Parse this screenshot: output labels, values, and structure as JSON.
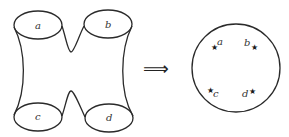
{
  "diagram": {
    "type": "topology-transformation",
    "stroke_color": "#2a2a2a",
    "left_figure": {
      "description": "surface with four boundary circles",
      "boundaries": [
        {
          "label": "a",
          "cx": 38,
          "cy": 25,
          "rx": 24,
          "ry": 14
        },
        {
          "label": "b",
          "cx": 108,
          "cy": 24,
          "rx": 24,
          "ry": 14
        },
        {
          "label": "c",
          "cx": 38,
          "cy": 117,
          "rx": 24,
          "ry": 14
        },
        {
          "label": "d",
          "cx": 109,
          "cy": 118,
          "rx": 24,
          "ry": 14
        }
      ]
    },
    "arrow": {
      "symbol": "⟹",
      "meaning": "implies / maps to"
    },
    "right_figure": {
      "description": "disk with four marked points",
      "circle": {
        "cx": 236,
        "cy": 68,
        "r": 44
      },
      "points": [
        {
          "label": "a",
          "star": "★",
          "star_x": 215,
          "star_y": 47,
          "label_x": 220,
          "label_y": 44,
          "label_side": "right"
        },
        {
          "label": "b",
          "star": "★",
          "star_x": 254,
          "star_y": 47,
          "label_x": 245,
          "label_y": 44,
          "label_side": "left"
        },
        {
          "label": "c",
          "star": "★",
          "star_x": 211,
          "star_y": 91,
          "label_x": 215,
          "label_y": 96,
          "label_side": "right"
        },
        {
          "label": "d",
          "star": "★",
          "star_x": 251,
          "star_y": 92,
          "label_x": 243,
          "label_y": 95,
          "label_side": "left"
        }
      ]
    }
  }
}
